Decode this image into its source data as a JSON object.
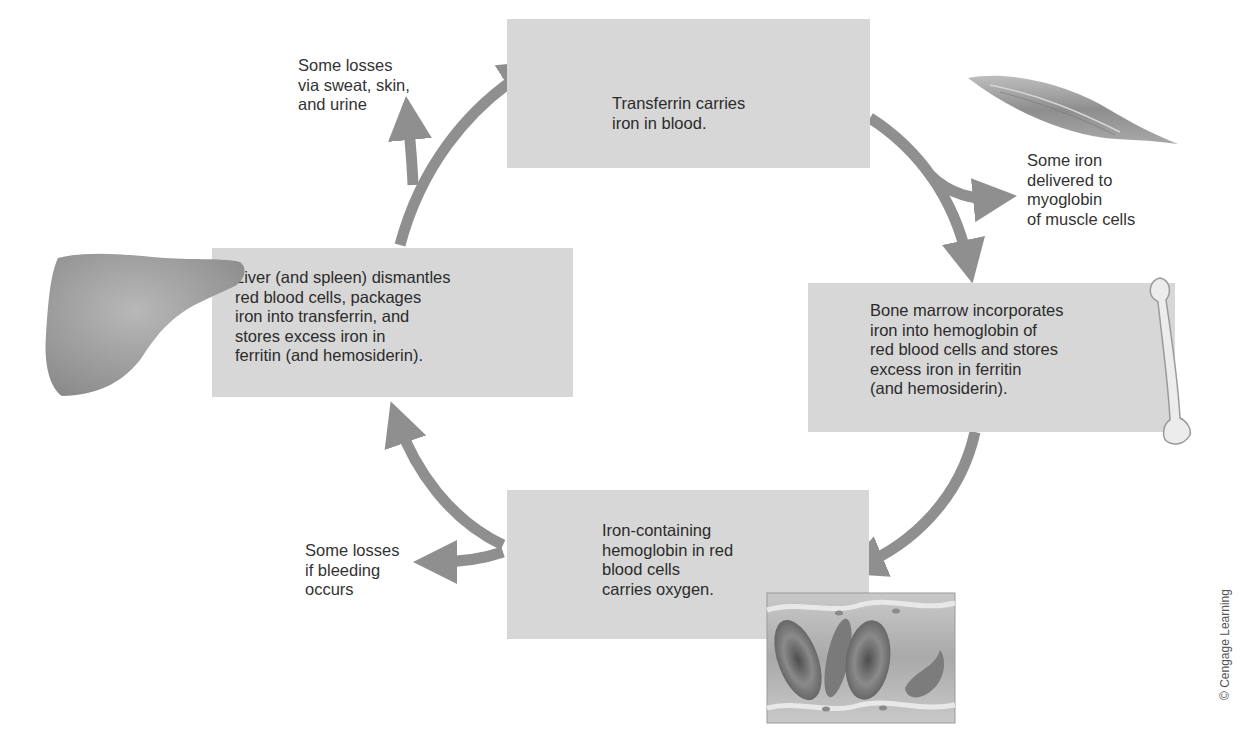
{
  "diagram": {
    "colors": {
      "box_fill": "#d7d7d7",
      "arrow": "#8f8f8f",
      "text": "#2b2b2b",
      "background": "#ffffff"
    },
    "nodes": [
      {
        "id": "transferrin",
        "text": "Transferrin carries\niron in blood."
      },
      {
        "id": "bone_marrow",
        "text": "Bone marrow incorporates\niron into hemoglobin of\nred blood cells and stores\nexcess iron in ferritin\n(and hemosiderin)."
      },
      {
        "id": "red_blood_cells",
        "text": "Iron-containing\nhemoglobin in red\nblood cells\ncarries oxygen."
      },
      {
        "id": "liver",
        "text": "Liver (and spleen) dismantles\nred blood cells, packages\niron into transferrin, and\nstores excess iron in\nferritin (and hemosiderin)."
      }
    ],
    "side_labels": [
      {
        "id": "myoglobin",
        "text": "Some iron\ndelivered to\nmyoglobin\nof muscle cells"
      },
      {
        "id": "sweat_losses",
        "text": "Some losses\nvia sweat, skin,\nand urine"
      },
      {
        "id": "bleeding_losses",
        "text": "Some losses\nif bleeding\noccurs"
      }
    ],
    "edges": [
      {
        "from": "transferrin",
        "to": "bone_marrow"
      },
      {
        "from": "transferrin",
        "to": "myoglobin"
      },
      {
        "from": "bone_marrow",
        "to": "red_blood_cells"
      },
      {
        "from": "red_blood_cells",
        "to": "liver"
      },
      {
        "from": "red_blood_cells",
        "to": "bleeding_losses"
      },
      {
        "from": "liver",
        "to": "transferrin"
      },
      {
        "from": "liver",
        "to": "sweat_losses"
      }
    ],
    "illustrations": [
      "muscle",
      "bone",
      "blood-vessel-with-red-cells",
      "liver"
    ],
    "credit": "© Cengage Learning"
  }
}
